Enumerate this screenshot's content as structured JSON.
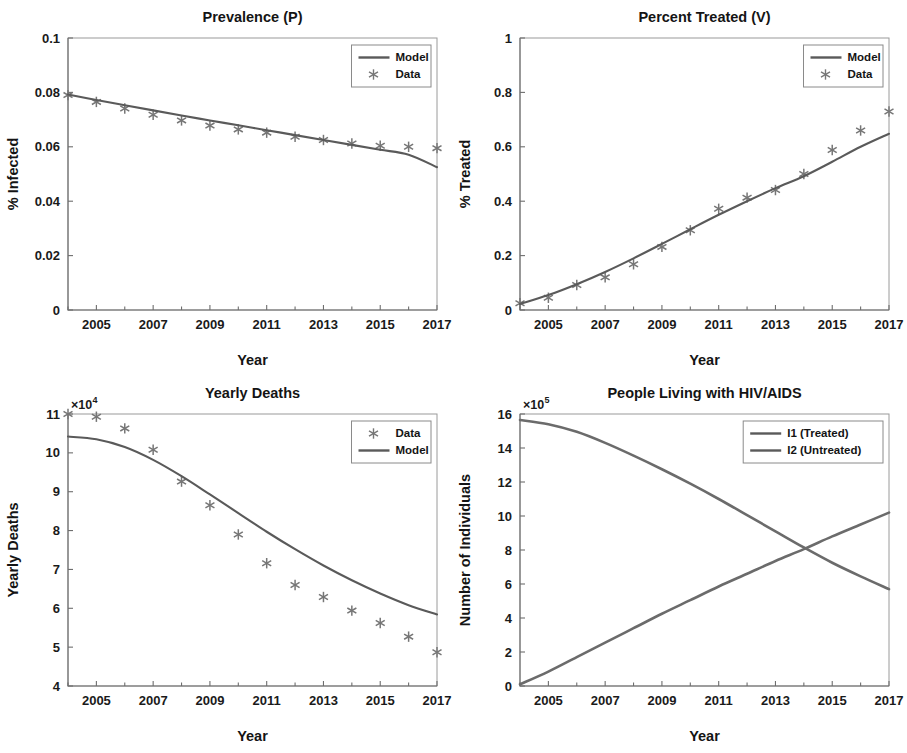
{
  "figure": {
    "background": "#ffffff",
    "line_color": "#5a5a5a",
    "marker_color": "#767676",
    "axis_color": "#6e6e6e",
    "width": 907,
    "height": 753
  },
  "chart_data": [
    {
      "id": "prevalence",
      "type": "scatter",
      "title": "Prevalence (P)",
      "xlabel": "Year",
      "ylabel": "% Infected",
      "xlim": [
        2004,
        2017
      ],
      "ylim": [
        0,
        0.1
      ],
      "xticks": [
        2005,
        2007,
        2009,
        2011,
        2013,
        2015,
        2017
      ],
      "xticklabels": [
        "2005",
        "2007",
        "2009",
        "2011",
        "2013",
        "2015",
        "2017"
      ],
      "xminorticks": [
        2004,
        2006,
        2008,
        2010,
        2012,
        2014,
        2016
      ],
      "yticks": [
        0,
        0.02,
        0.04,
        0.06,
        0.08,
        0.1
      ],
      "yticklabels": [
        "0",
        "0.02",
        "0.04",
        "0.06",
        "0.08",
        "0.1"
      ],
      "grid": false,
      "exponent_label": null,
      "legend": {
        "position": "top-right",
        "entries": [
          {
            "label": "Model",
            "kind": "line"
          },
          {
            "label": "Data",
            "kind": "marker"
          }
        ]
      },
      "x": [
        2004,
        2005,
        2006,
        2007,
        2008,
        2009,
        2010,
        2011,
        2012,
        2013,
        2014,
        2015,
        2016,
        2017
      ],
      "series": [
        {
          "name": "Data",
          "kind": "marker",
          "values": [
            0.079,
            0.0765,
            0.0741,
            0.0718,
            0.0697,
            0.0678,
            0.0664,
            0.0652,
            0.0637,
            0.0625,
            0.0612,
            0.0604,
            0.06,
            0.0595
          ]
        },
        {
          "name": "Model",
          "kind": "line",
          "values": [
            0.0792,
            0.0772,
            0.0753,
            0.0734,
            0.0715,
            0.0697,
            0.0679,
            0.0661,
            0.0643,
            0.0625,
            0.0607,
            0.0589,
            0.0571,
            0.0525
          ]
        }
      ]
    },
    {
      "id": "treated",
      "type": "scatter",
      "title": "Percent Treated (V)",
      "xlabel": "Year",
      "ylabel": "% Treated",
      "xlim": [
        2004,
        2017
      ],
      "ylim": [
        0,
        1
      ],
      "xticks": [
        2005,
        2007,
        2009,
        2011,
        2013,
        2015,
        2017
      ],
      "xticklabels": [
        "2005",
        "2007",
        "2009",
        "2011",
        "2013",
        "2015",
        "2017"
      ],
      "xminorticks": [
        2004,
        2006,
        2008,
        2010,
        2012,
        2014,
        2016
      ],
      "yticks": [
        0,
        0.2,
        0.4,
        0.6,
        0.8,
        1
      ],
      "yticklabels": [
        "0",
        "0.2",
        "0.4",
        "0.6",
        "0.8",
        "1"
      ],
      "grid": false,
      "exponent_label": null,
      "legend": {
        "position": "top-right",
        "entries": [
          {
            "label": "Model",
            "kind": "line"
          },
          {
            "label": "Data",
            "kind": "marker"
          }
        ]
      },
      "x": [
        2004,
        2005,
        2006,
        2007,
        2008,
        2009,
        2010,
        2011,
        2012,
        2013,
        2014,
        2015,
        2016,
        2017
      ],
      "series": [
        {
          "name": "Data",
          "kind": "marker",
          "values": [
            0.025,
            0.045,
            0.092,
            0.12,
            0.168,
            0.232,
            0.293,
            0.372,
            0.413,
            0.441,
            0.5,
            0.588,
            0.66,
            0.73
          ]
        },
        {
          "name": "Model",
          "kind": "line",
          "values": [
            0.022,
            0.055,
            0.095,
            0.14,
            0.19,
            0.243,
            0.297,
            0.35,
            0.4,
            0.448,
            0.492,
            0.545,
            0.6,
            0.648
          ]
        }
      ]
    },
    {
      "id": "yearly-deaths",
      "type": "scatter",
      "title": "Yearly Deaths",
      "xlabel": "Year",
      "ylabel": "Yearly Deaths",
      "xlim": [
        2004,
        2017
      ],
      "ylim": [
        4,
        11
      ],
      "xticks": [
        2005,
        2007,
        2009,
        2011,
        2013,
        2015,
        2017
      ],
      "xticklabels": [
        "2005",
        "2007",
        "2009",
        "2011",
        "2013",
        "2015",
        "2017"
      ],
      "xminorticks": [
        2004,
        2006,
        2008,
        2010,
        2012,
        2014,
        2016
      ],
      "yticks": [
        4,
        5,
        6,
        7,
        8,
        9,
        10,
        11
      ],
      "yticklabels": [
        "4",
        "5",
        "6",
        "7",
        "8",
        "9",
        "10",
        "11"
      ],
      "grid": false,
      "exponent_label": "10",
      "exponent_power": "4",
      "exponent_prefix": "×",
      "legend": {
        "position": "top-right",
        "entries": [
          {
            "label": "Data",
            "kind": "marker"
          },
          {
            "label": "Model",
            "kind": "line"
          }
        ]
      },
      "x": [
        2004,
        2005,
        2006,
        2007,
        2008,
        2009,
        2010,
        2011,
        2012,
        2013,
        2014,
        2015,
        2016,
        2017
      ],
      "series": [
        {
          "name": "Data",
          "kind": "marker",
          "values": [
            11.0,
            10.93,
            10.63,
            10.08,
            9.26,
            8.65,
            7.9,
            7.16,
            6.6,
            6.29,
            5.94,
            5.62,
            5.27,
            4.87
          ]
        },
        {
          "name": "Model",
          "kind": "line",
          "values": [
            10.42,
            10.35,
            10.15,
            9.82,
            9.4,
            8.93,
            8.45,
            7.97,
            7.52,
            7.1,
            6.72,
            6.38,
            6.08,
            5.84
          ]
        }
      ]
    },
    {
      "id": "plwha",
      "type": "line",
      "title": "People Living with HIV/AIDS",
      "xlabel": "Year",
      "ylabel": "Number of Individuals",
      "xlim": [
        2004,
        2017
      ],
      "ylim": [
        0,
        16
      ],
      "xticks": [
        2005,
        2007,
        2009,
        2011,
        2013,
        2015,
        2017
      ],
      "xticklabels": [
        "2005",
        "2007",
        "2009",
        "2011",
        "2013",
        "2015",
        "2017"
      ],
      "xminorticks": [
        2004,
        2006,
        2008,
        2010,
        2012,
        2014,
        2016
      ],
      "yticks": [
        0,
        2,
        4,
        6,
        8,
        10,
        12,
        14,
        16
      ],
      "yticklabels": [
        "0",
        "2",
        "4",
        "6",
        "8",
        "10",
        "12",
        "14",
        "16"
      ],
      "grid": false,
      "exponent_label": "10",
      "exponent_power": "5",
      "exponent_prefix": "×",
      "legend": {
        "position": "top-right",
        "entries": [
          {
            "label": "I1 (Treated)",
            "kind": "line"
          },
          {
            "label": "I2 (Untreated)",
            "kind": "line"
          }
        ]
      },
      "x": [
        2004,
        2005,
        2006,
        2007,
        2008,
        2009,
        2010,
        2011,
        2012,
        2013,
        2014,
        2015,
        2016,
        2017
      ],
      "series": [
        {
          "name": "I1 (Treated)",
          "kind": "line",
          "values": [
            0.1,
            0.85,
            1.7,
            2.55,
            3.4,
            4.25,
            5.05,
            5.85,
            6.6,
            7.35,
            8.05,
            8.8,
            9.5,
            10.2
          ]
        },
        {
          "name": "I2 (Untreated)",
          "kind": "line",
          "values": [
            15.65,
            15.4,
            14.95,
            14.3,
            13.55,
            12.75,
            11.9,
            11.0,
            10.05,
            9.1,
            8.15,
            7.25,
            6.45,
            5.7
          ]
        }
      ]
    }
  ]
}
